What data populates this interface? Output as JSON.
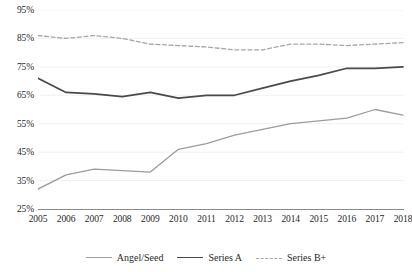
{
  "chart_data": {
    "type": "line",
    "title": "",
    "subtitle": "",
    "xlabel": "",
    "ylabel": "",
    "x": [
      2005,
      2006,
      2007,
      2008,
      2009,
      2010,
      2011,
      2012,
      2013,
      2014,
      2015,
      2016,
      2017,
      2018
    ],
    "categories": [
      "2005",
      "2006",
      "2007",
      "2008",
      "2009",
      "2010",
      "2011",
      "2012",
      "2013",
      "2014",
      "2015",
      "2016",
      "2017",
      "2018"
    ],
    "ylim": [
      25,
      95
    ],
    "ytick_step": 10,
    "ytick_labels": [
      "25%",
      "35%",
      "45%",
      "55%",
      "65%",
      "75%",
      "85%",
      "95%"
    ],
    "ytick_values": [
      25,
      35,
      45,
      55,
      65,
      75,
      85,
      95
    ],
    "grid": true,
    "grid_axis": "y",
    "legend_position": "bottom",
    "series": [
      {
        "name": "Angel/Seed",
        "style": "solid",
        "color": "#9c9c9c",
        "values": [
          32,
          37,
          39,
          38.5,
          38,
          46,
          48,
          51,
          53,
          55,
          56,
          57,
          60,
          58
        ]
      },
      {
        "name": "Series A",
        "style": "solid",
        "color": "#4a4a4a",
        "values": [
          71,
          66,
          65.5,
          64.5,
          66,
          64,
          65,
          65,
          67.5,
          70,
          72,
          74.5,
          74.5,
          75
        ]
      },
      {
        "name": "Series B+",
        "style": "dashed",
        "color": "#a6a6a6",
        "values": [
          86,
          85,
          86,
          85,
          83,
          82.5,
          82,
          81,
          81,
          83,
          83,
          82.5,
          83,
          83.5
        ]
      }
    ]
  },
  "axis": {
    "y_labels": [
      "95%",
      "85%",
      "75%",
      "65%",
      "55%",
      "45%",
      "35%",
      "25%"
    ],
    "x_labels": [
      "2005",
      "2006",
      "2007",
      "2008",
      "2009",
      "2010",
      "2011",
      "2012",
      "2013",
      "2014",
      "2015",
      "2016",
      "2017",
      "2018"
    ]
  },
  "legend": {
    "items": [
      {
        "label": "Angel/Seed",
        "color": "#9c9c9c",
        "style": "solid"
      },
      {
        "label": "Series A",
        "color": "#4a4a4a",
        "style": "solid"
      },
      {
        "label": "Series B+",
        "color": "#a6a6a6",
        "style": "dashed"
      }
    ]
  }
}
